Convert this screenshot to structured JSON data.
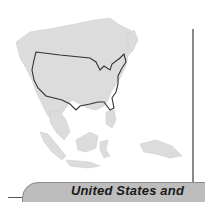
{
  "figure": {
    "caption_tab": "United States and",
    "map_description": "Outline of the contiguous United States overlaid on a map of East and Southeast Asia"
  },
  "colors": {
    "land_fill": "#dcdcdc",
    "us_outline": "#333333",
    "tab_fill": "#bdbdbd",
    "rule": "#8a8a8a"
  }
}
